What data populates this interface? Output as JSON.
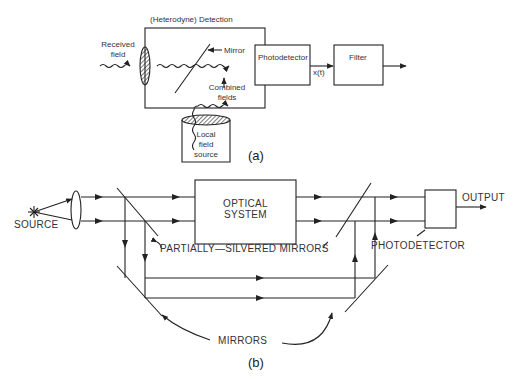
{
  "figure_a": {
    "title": "(Heterodyne) Detection",
    "received_field": "Received\nfield",
    "received_field_line1": "Received",
    "received_field_line2": "field",
    "mirror": "Mirror",
    "combined_fields_line1": "Combined",
    "combined_fields_line2": "fields",
    "local_source_line1": "Local",
    "local_source_line2": "field",
    "local_source_line3": "source",
    "photodetector": "Photodetector",
    "signal": "x(t)",
    "filter": "Filter",
    "caption": "(a)"
  },
  "figure_b": {
    "source": "SOURCE",
    "optical_system_line1": "OPTICAL",
    "optical_system_line2": "SYSTEM",
    "partially_silvered": "PARTIALLY—SILVERED MIRRORS",
    "photodetector": "PHOTODETECTOR",
    "output": "OUTPUT",
    "mirrors": "MIRRORS",
    "caption": "(b)"
  },
  "colors": {
    "line": "#222222",
    "background": "#ffffff"
  }
}
